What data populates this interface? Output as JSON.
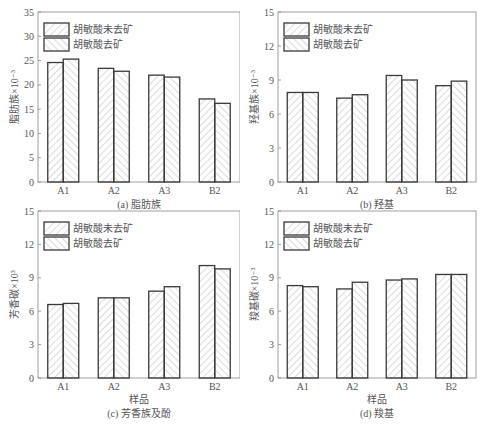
{
  "legend": {
    "series_0": "胡敏酸未去矿",
    "series_1": "胡敏酸去矿"
  },
  "colors": {
    "bar_stroke": "#3a3a3a",
    "hatch": "#b8b8b8",
    "axis": "#888888",
    "text": "#555555"
  },
  "chart_data": [
    {
      "id": "a",
      "type": "bar",
      "title": "(a) 脂肪族",
      "xlabel": "",
      "ylabel": "脂肪族×10⁻³",
      "ylim": [
        0,
        35
      ],
      "yticks": [
        0,
        5,
        10,
        15,
        20,
        25,
        30,
        35
      ],
      "categories": [
        "A1",
        "A2",
        "A3",
        "B2"
      ],
      "series": [
        {
          "name": "胡敏酸未去矿",
          "hatch": "forward",
          "values": [
            24.6,
            23.4,
            22.0,
            17.1
          ]
        },
        {
          "name": "胡敏酸去矿",
          "hatch": "backward",
          "values": [
            25.3,
            22.8,
            21.6,
            16.2
          ]
        }
      ],
      "legend_position": "upper left",
      "grid": false
    },
    {
      "id": "b",
      "type": "bar",
      "title": "(b) 羟基",
      "xlabel": "",
      "ylabel": "羟基族×10⁻³",
      "ylim": [
        0,
        15
      ],
      "yticks": [
        0,
        3,
        6,
        9,
        12,
        15
      ],
      "categories": [
        "A1",
        "A2",
        "A3",
        "B2"
      ],
      "series": [
        {
          "name": "胡敏酸未去矿",
          "hatch": "forward",
          "values": [
            7.9,
            7.4,
            9.4,
            8.5
          ]
        },
        {
          "name": "胡敏酸去矿",
          "hatch": "backward",
          "values": [
            7.9,
            7.7,
            9.0,
            8.9
          ]
        }
      ],
      "legend_position": "upper left",
      "grid": false
    },
    {
      "id": "c",
      "type": "bar",
      "title": "(c) 芳香族及酚",
      "xlabel": "样品",
      "ylabel": "芳香碳×10³",
      "ylim": [
        0,
        15
      ],
      "yticks": [
        0,
        3,
        6,
        9,
        12,
        15
      ],
      "categories": [
        "A1",
        "A2",
        "A3",
        "B2"
      ],
      "series": [
        {
          "name": "胡敏酸未去矿",
          "hatch": "forward",
          "values": [
            6.6,
            7.2,
            7.8,
            10.1
          ]
        },
        {
          "name": "胡敏酸去矿",
          "hatch": "backward",
          "values": [
            6.7,
            7.2,
            8.2,
            9.8
          ]
        }
      ],
      "legend_position": "upper left",
      "grid": false
    },
    {
      "id": "d",
      "type": "bar",
      "title": "(d) 羧基",
      "xlabel": "样品",
      "ylabel": "羧基碳×10⁻³",
      "ylim": [
        0,
        15
      ],
      "yticks": [
        0,
        3,
        6,
        9,
        12,
        15
      ],
      "categories": [
        "A1",
        "A2",
        "A3",
        "B2"
      ],
      "series": [
        {
          "name": "胡敏酸未去矿",
          "hatch": "forward",
          "values": [
            8.3,
            8.0,
            8.8,
            9.3
          ]
        },
        {
          "name": "胡敏酸去矿",
          "hatch": "backward",
          "values": [
            8.2,
            8.6,
            8.9,
            9.3
          ]
        }
      ],
      "legend_position": "upper left",
      "grid": false
    }
  ]
}
